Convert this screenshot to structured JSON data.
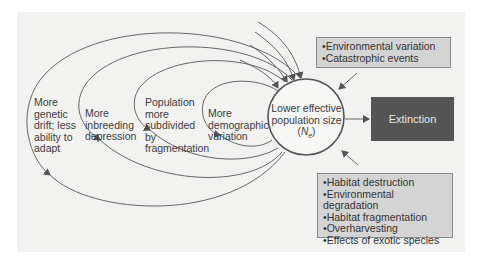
{
  "diagram": {
    "center_node": {
      "line1": "Lower effective",
      "line2": "population size",
      "symbol_main": "N",
      "symbol_sub": "e",
      "symbol_open": "(",
      "symbol_close": ")"
    },
    "feedback_loops": [
      {
        "lines": [
          "More",
          "demographic",
          "variation"
        ]
      },
      {
        "lines": [
          "Population",
          "more",
          "subdivided",
          "by",
          "fragmentation"
        ]
      },
      {
        "lines": [
          "More",
          "inbreeding",
          "depression"
        ]
      },
      {
        "lines": [
          "More",
          "genetic",
          "drift; less",
          "ability to",
          "adapt"
        ]
      }
    ],
    "outcome": {
      "label": "Extinction"
    },
    "external_factors_top": {
      "items": [
        "Environmental variation",
        "Catastrophic events"
      ]
    },
    "external_factors_bottom": {
      "items": [
        "Habitat destruction",
        "Environmental degradation",
        "Habitat fragmentation",
        "Overharvesting",
        "Effects of exotic species"
      ]
    },
    "colors": {
      "background_panel": "#f2f2f1",
      "factor_box": "#d4d4d4",
      "extinction_box": "#555555",
      "lines": "#555555"
    }
  }
}
